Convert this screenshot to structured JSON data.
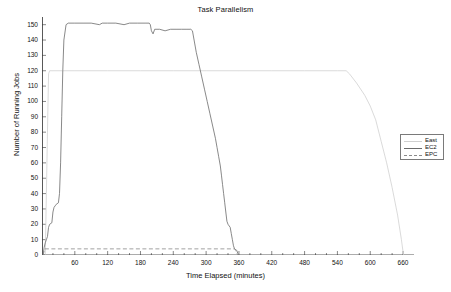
{
  "chart_data": {
    "type": "line",
    "title": "Task Parallelism",
    "xlabel": "Time Elapsed (minutes)",
    "ylabel": "Number of Running Jobs",
    "xlim": [
      0,
      680
    ],
    "ylim": [
      0,
      155
    ],
    "xticks": [
      60,
      120,
      180,
      240,
      300,
      360,
      420,
      480,
      540,
      600,
      660
    ],
    "yticks": [
      0,
      10,
      20,
      30,
      40,
      50,
      60,
      70,
      80,
      90,
      100,
      110,
      120,
      130,
      140,
      150
    ],
    "grid": false,
    "legend_position": "right",
    "series": [
      {
        "name": "East",
        "style": "solid",
        "color": "#d0d0d0",
        "points": [
          [
            6,
            0
          ],
          [
            8,
            40
          ],
          [
            10,
            80
          ],
          [
            12,
            118
          ],
          [
            14,
            120
          ],
          [
            20,
            120
          ],
          [
            60,
            120
          ],
          [
            120,
            120
          ],
          [
            180,
            120
          ],
          [
            240,
            120
          ],
          [
            300,
            120
          ],
          [
            360,
            120
          ],
          [
            420,
            120
          ],
          [
            480,
            120
          ],
          [
            540,
            120
          ],
          [
            556,
            120
          ],
          [
            562,
            118
          ],
          [
            575,
            112
          ],
          [
            590,
            104
          ],
          [
            600,
            97
          ],
          [
            610,
            88
          ],
          [
            620,
            74
          ],
          [
            630,
            60
          ],
          [
            640,
            44
          ],
          [
            650,
            26
          ],
          [
            657,
            10
          ],
          [
            660,
            2
          ],
          [
            661,
            0
          ]
        ]
      },
      {
        "name": "EC2",
        "style": "solid",
        "color": "#6b6b6b",
        "points": [
          [
            2,
            0
          ],
          [
            4,
            5
          ],
          [
            6,
            8
          ],
          [
            8,
            10
          ],
          [
            10,
            12
          ],
          [
            12,
            18
          ],
          [
            14,
            20
          ],
          [
            18,
            21
          ],
          [
            20,
            28
          ],
          [
            22,
            31
          ],
          [
            24,
            32
          ],
          [
            26,
            33
          ],
          [
            30,
            34
          ],
          [
            32,
            40
          ],
          [
            34,
            60
          ],
          [
            36,
            90
          ],
          [
            38,
            120
          ],
          [
            40,
            140
          ],
          [
            44,
            150
          ],
          [
            48,
            151
          ],
          [
            60,
            151
          ],
          [
            75,
            151
          ],
          [
            90,
            151
          ],
          [
            105,
            150
          ],
          [
            110,
            151
          ],
          [
            120,
            151
          ],
          [
            135,
            151
          ],
          [
            150,
            150
          ],
          [
            160,
            151
          ],
          [
            175,
            151
          ],
          [
            190,
            151
          ],
          [
            196,
            151
          ],
          [
            198,
            150
          ],
          [
            200,
            146
          ],
          [
            203,
            144
          ],
          [
            206,
            147
          ],
          [
            215,
            147
          ],
          [
            225,
            146
          ],
          [
            235,
            147
          ],
          [
            245,
            147
          ],
          [
            255,
            147
          ],
          [
            265,
            147
          ],
          [
            272,
            147
          ],
          [
            275,
            146
          ],
          [
            278,
            140
          ],
          [
            282,
            132
          ],
          [
            287,
            124
          ],
          [
            292,
            116
          ],
          [
            297,
            108
          ],
          [
            302,
            100
          ],
          [
            307,
            92
          ],
          [
            312,
            84
          ],
          [
            317,
            76
          ],
          [
            320,
            70
          ],
          [
            323,
            64
          ],
          [
            326,
            58
          ],
          [
            328,
            52
          ],
          [
            330,
            46
          ],
          [
            332,
            40
          ],
          [
            334,
            34
          ],
          [
            336,
            28
          ],
          [
            338,
            22
          ],
          [
            340,
            20
          ],
          [
            344,
            18
          ],
          [
            346,
            14
          ],
          [
            348,
            10
          ],
          [
            350,
            6
          ],
          [
            352,
            4
          ],
          [
            356,
            3
          ],
          [
            358,
            1
          ],
          [
            360,
            0
          ]
        ]
      },
      {
        "name": "EPC",
        "style": "dashed",
        "color": "#8a8a8a",
        "points": [
          [
            2,
            0
          ],
          [
            5,
            4
          ],
          [
            20,
            4
          ],
          [
            60,
            4
          ],
          [
            120,
            4
          ],
          [
            180,
            4
          ],
          [
            240,
            4
          ],
          [
            300,
            4
          ],
          [
            340,
            4
          ],
          [
            352,
            4
          ],
          [
            354,
            3
          ],
          [
            356,
            1
          ],
          [
            358,
            0
          ],
          [
            362,
            0
          ]
        ]
      }
    ]
  },
  "legend": {
    "items": [
      {
        "label": "East"
      },
      {
        "label": "EC2"
      },
      {
        "label": "EPC"
      }
    ]
  }
}
